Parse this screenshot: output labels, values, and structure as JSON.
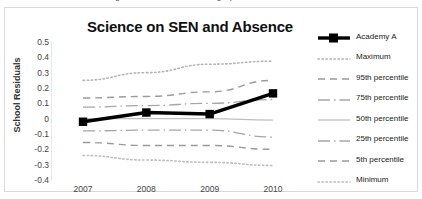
{
  "clipped_top_text": "chart of science residuals against SEN and absence graph",
  "chart_data": {
    "type": "line",
    "title": "Science on SEN and Absence",
    "xlabel": "",
    "ylabel": "School Residuals",
    "categories": [
      "2007",
      "2008",
      "2009",
      "2010"
    ],
    "x": [
      2007,
      2008,
      2009,
      2010
    ],
    "ylim": [
      -0.4,
      0.5
    ],
    "yticks": [
      "0.5",
      "0.4",
      "0.3",
      "0.2",
      "0.1",
      "0",
      "-0.1",
      "-0.2",
      "-0.3",
      "-0.4"
    ],
    "ytick_values": [
      0.5,
      0.4,
      0.3,
      0.2,
      0.1,
      0,
      -0.1,
      -0.2,
      -0.3,
      -0.4
    ],
    "grid": false,
    "legend_position": "right",
    "series": [
      {
        "name": "Academy A",
        "values": [
          -0.02,
          0.04,
          0.03,
          0.165
        ],
        "color": "#000000",
        "style": "solid-thick-marker",
        "marker": "square"
      },
      {
        "name": "Maximum",
        "values": [
          0.25,
          0.3,
          0.355,
          0.375
        ],
        "color": "#b3b3b3",
        "style": "dotted"
      },
      {
        "name": "95th percentile",
        "values": [
          0.135,
          0.145,
          0.175,
          0.25
        ],
        "color": "#9a9a9a",
        "style": "dashed"
      },
      {
        "name": "75th percentile",
        "values": [
          0.075,
          0.085,
          0.1,
          0.125
        ],
        "color": "#a6a6a6",
        "style": "dashdot"
      },
      {
        "name": "50th percentile",
        "values": [
          0.0,
          0.0,
          0.0,
          -0.01
        ],
        "color": "#bfbfbf",
        "style": "solid"
      },
      {
        "name": "25th  percentile",
        "values": [
          -0.08,
          -0.075,
          -0.075,
          -0.12
        ],
        "color": "#a6a6a6",
        "style": "dashdot"
      },
      {
        "name": "5th percentile",
        "values": [
          -0.155,
          -0.175,
          -0.175,
          -0.2
        ],
        "color": "#9a9a9a",
        "style": "dashed"
      },
      {
        "name": "Minimum",
        "values": [
          -0.24,
          -0.27,
          -0.285,
          -0.305
        ],
        "color": "#bdbdbd",
        "style": "dotted"
      }
    ]
  }
}
